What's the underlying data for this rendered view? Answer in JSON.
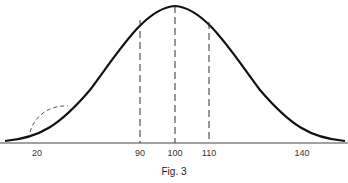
{
  "figure": {
    "caption": "Fig. 3",
    "ticks": [
      {
        "label": "20",
        "x": 37
      },
      {
        "label": "90",
        "x": 140
      },
      {
        "label": "100",
        "x": 175
      },
      {
        "label": "110",
        "x": 209
      },
      {
        "label": "140",
        "x": 302
      }
    ],
    "dashed_lines_at": [
      "90",
      "100",
      "110"
    ],
    "curve": "bell-shaped normal curve with peak at 100",
    "inset_curve": "dashed bump near 20"
  }
}
